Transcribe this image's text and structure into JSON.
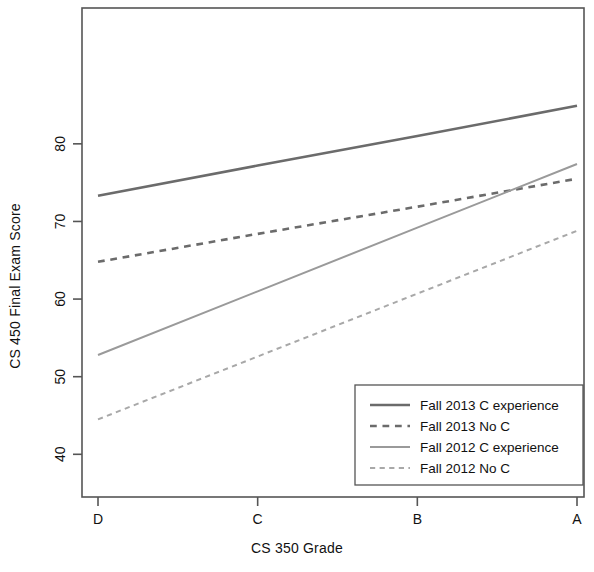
{
  "chart_data": {
    "type": "line",
    "title": "",
    "xlabel": "CS 350 Grade",
    "ylabel": "CS 450 Final Exam Score",
    "categories": [
      "D",
      "C",
      "B",
      "A"
    ],
    "x_tick_labels": [
      "D",
      "C",
      "B",
      "A"
    ],
    "y_tick_labels": [
      "40",
      "50",
      "60",
      "70",
      "80"
    ],
    "y_ticks": [
      40,
      50,
      60,
      70,
      80
    ],
    "ylim": [
      34.5,
      97.5
    ],
    "xlim": [
      0,
      3
    ],
    "grid": false,
    "frame": true,
    "legend_position": "bottom-right",
    "series": [
      {
        "name": "Fall 2013 C experience",
        "style": "solid",
        "color": "#6b6b6b",
        "width": 2.6,
        "values": [
          73.3,
          77.2,
          81.0,
          84.9
        ]
      },
      {
        "name": "Fall 2013 No C",
        "style": "dashed",
        "color": "#6b6b6b",
        "width": 2.6,
        "values": [
          64.8,
          68.4,
          71.9,
          75.5
        ]
      },
      {
        "name": "Fall 2012 C experience",
        "style": "solid",
        "color": "#9a9a9a",
        "width": 2.0,
        "values": [
          52.8,
          61.0,
          69.2,
          77.4
        ]
      },
      {
        "name": "Fall 2012 No C",
        "style": "dashed",
        "color": "#a8a8a8",
        "width": 2.0,
        "values": [
          44.5,
          52.6,
          60.7,
          68.8
        ]
      }
    ]
  },
  "legend": {
    "entries": [
      "Fall 2013 C experience",
      "Fall 2013 No C",
      "Fall 2012 C experience",
      "Fall 2012 No C"
    ]
  },
  "axes": {
    "x_title": "CS 350 Grade",
    "y_title": "CS 450 Final Exam Score",
    "x_ticks": [
      "D",
      "C",
      "B",
      "A"
    ],
    "y_ticks": [
      "40",
      "50",
      "60",
      "70",
      "80"
    ]
  }
}
